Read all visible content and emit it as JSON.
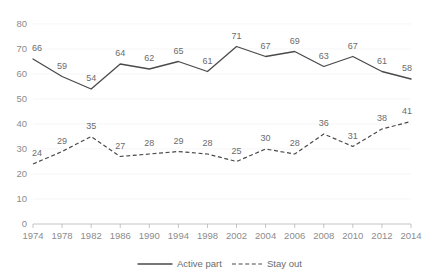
{
  "chart_data": {
    "type": "line",
    "title": "",
    "subtitle": "",
    "xlabel": "",
    "ylabel": "",
    "ylim": [
      0,
      80
    ],
    "ytick_labels": [
      "0",
      "10",
      "20",
      "30",
      "40",
      "50",
      "60",
      "70",
      "80"
    ],
    "yticks": [
      0,
      10,
      20,
      30,
      40,
      50,
      60,
      70,
      80
    ],
    "grid": true,
    "grid_axis": "y",
    "legend_position": "bottom",
    "categories": [
      "1974",
      "1978",
      "1982",
      "1986",
      "1990",
      "1994",
      "1998",
      "2002",
      "2004",
      "2006",
      "2008",
      "2010",
      "2012",
      "2014"
    ],
    "series": [
      {
        "name": "Active part",
        "style": "solid",
        "color": "#4a4a4a",
        "values": [
          66,
          59,
          54,
          64,
          62,
          65,
          61,
          71,
          67,
          69,
          63,
          67,
          61,
          58
        ],
        "labels": [
          "66",
          "59",
          "54",
          "64",
          "62",
          "65",
          "61",
          "71",
          "67",
          "69",
          "63",
          "67",
          "61",
          "58"
        ]
      },
      {
        "name": "Stay out",
        "style": "dashed",
        "color": "#4a4a4a",
        "values": [
          24,
          29,
          35,
          27,
          28,
          29,
          28,
          25,
          30,
          28,
          36,
          31,
          38,
          41
        ],
        "labels": [
          "24",
          "29",
          "35",
          "27",
          "28",
          "29",
          "28",
          "25",
          "30",
          "28",
          "36",
          "31",
          "38",
          "41"
        ]
      }
    ],
    "legend": [
      {
        "label": "Active part",
        "style": "solid"
      },
      {
        "label": "Stay out",
        "style": "dashed"
      }
    ]
  }
}
